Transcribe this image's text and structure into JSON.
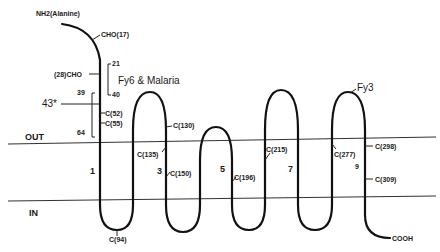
{
  "figure": {
    "n_terminus": "NH2(Alanine)",
    "c_terminus": "COOH",
    "regions": {
      "outside": "OUT",
      "inside": "IN"
    },
    "epitopes": [
      {
        "label": "Fy6 & Malaria",
        "range_start": "21",
        "range_end": "40"
      },
      {
        "label": "Fy3"
      }
    ],
    "marker_43": "43*",
    "bracket_labels": {
      "start": "39",
      "end": "64"
    },
    "glycosylation_sites": [
      "CHO(17)",
      "(28)CHO"
    ],
    "cysteines": [
      "C(52)",
      "C(55)",
      "C(94)",
      "C(130)",
      "C(135)",
      "C(150)",
      "C(196)",
      "C(215)",
      "C(277)",
      "C(298)",
      "C(309)"
    ],
    "helix_numbers": [
      "1",
      "3",
      "5",
      "7",
      "9"
    ]
  }
}
